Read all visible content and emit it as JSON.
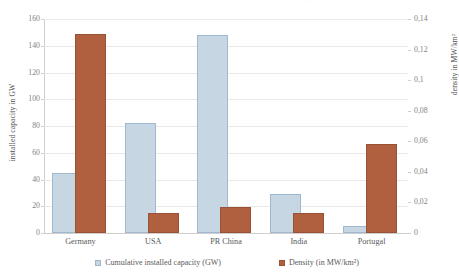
{
  "chart_data": {
    "type": "bar",
    "title": "Installed PV - cumulative installed capacity",
    "categories": [
      "Germany",
      "USA",
      "PR China",
      "India",
      "Portugal"
    ],
    "series": [
      {
        "name": "Cumulative installed capacity (GW)",
        "axis": "left",
        "color": "#c6d6e3",
        "values": [
          45,
          82,
          148,
          29,
          5
        ]
      },
      {
        "name": "Density (in MW/km²)",
        "axis": "right",
        "color": "#b0603f",
        "values": [
          0.13,
          0.013,
          0.017,
          0.013,
          0.058
        ]
      }
    ],
    "xlabel": "",
    "ylabel": "installed capacity in GW",
    "ylabel_right": "density in MW/km²",
    "ylim": [
      0,
      160
    ],
    "ylim_right": [
      0,
      0.14
    ],
    "yticks_left": [
      "0",
      "20",
      "40",
      "60",
      "80",
      "100",
      "120",
      "140",
      "160"
    ],
    "yticks_right": [
      "0",
      "0,02",
      "0,04",
      "0,06",
      "0,08",
      "0,1",
      "0,12",
      "0,14"
    ],
    "grid": true,
    "legend_position": "bottom"
  },
  "legend": {
    "items": [
      {
        "label": "Cumulative installed capacity (GW)"
      },
      {
        "label": "Density (in MW/km²)"
      }
    ]
  }
}
